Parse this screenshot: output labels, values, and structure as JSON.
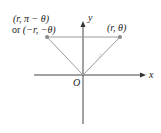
{
  "diagram": {
    "axes": {
      "x_label": "x",
      "y_label": "y",
      "origin_label": "O",
      "origin_px": [
        83,
        75
      ],
      "x_range_px": [
        34,
        146
      ],
      "y_range_px": [
        124,
        22
      ]
    },
    "points": [
      {
        "id": "right",
        "label": "(r,  θ)",
        "px": [
          120,
          37
        ]
      },
      {
        "id": "left",
        "label_line1": "(r,  π − θ)",
        "label_line2_prefix": "or ",
        "label_line2": "(−r,  −θ)",
        "px": [
          47,
          37
        ]
      }
    ],
    "colors": {
      "axis": "#333333",
      "construction_line": "#9a9a9a",
      "point": "#8a8a8a",
      "text": "#222222"
    }
  }
}
